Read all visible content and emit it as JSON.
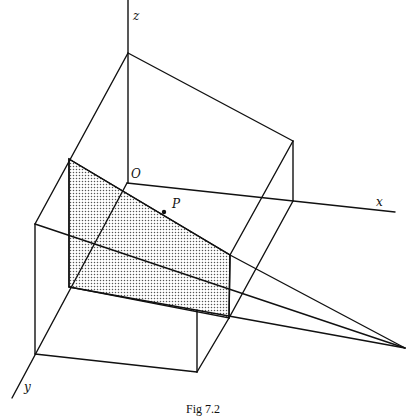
{
  "figure": {
    "caption": "Fig 7.2",
    "labels": {
      "z_axis": "z",
      "x_axis": "x",
      "y_axis": "y",
      "origin": "O",
      "point": "P"
    },
    "colors": {
      "line": "#111111",
      "shade_dot": "#555555",
      "background": "#ffffff"
    }
  }
}
